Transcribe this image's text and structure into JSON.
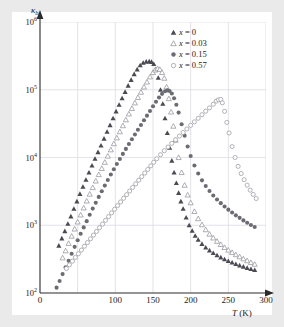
{
  "figure": {
    "axis_y_title": "κ",
    "axis_y_subscript": "b",
    "axis_x_title_symbol": "T",
    "axis_x_title_unit": " (K)"
  },
  "legend": {
    "items": [
      {
        "label": "x = 0",
        "marker": "filled-triangle-up",
        "color": "#4a4a52"
      },
      {
        "label": "x = 0.03",
        "marker": "open-triangle-up",
        "color": "#8d8d95"
      },
      {
        "label": "x = 0.15",
        "marker": "filled-circle",
        "color": "#6b6b73"
      },
      {
        "label": "x = 0.57",
        "marker": "open-circle",
        "color": "#9a9aa2"
      }
    ]
  },
  "chart_data": {
    "type": "scatter",
    "title": "",
    "xlabel": "T (K)",
    "ylabel": "κ_b",
    "xlim": [
      0,
      300
    ],
    "ylim": [
      100,
      1000000
    ],
    "yscale": "log",
    "xticks": [
      0,
      50,
      100,
      150,
      200,
      250,
      300
    ],
    "xticklabels": [
      "0",
      "",
      "100",
      "150",
      "200",
      "250",
      "300"
    ],
    "yticks": [
      100,
      1000,
      10000,
      100000,
      1000000
    ],
    "yticklabels": [
      "10²",
      "10³",
      "10⁴",
      "10⁵",
      "10⁶"
    ],
    "grid": true,
    "legend_position": "top-right",
    "series": [
      {
        "name": "x = 0",
        "marker": "filled-triangle-up",
        "color": "#4a4a52",
        "peak_temperature": 150,
        "peak_value": 260000,
        "x": [
          25,
          29,
          33,
          37,
          41,
          45,
          49,
          53,
          57,
          61,
          65,
          69,
          73,
          77,
          81,
          85,
          89,
          93,
          97,
          101,
          105,
          109,
          113,
          117,
          121,
          125,
          129,
          133,
          137,
          141,
          145,
          148,
          151,
          154,
          157,
          160,
          163,
          166,
          169,
          172,
          175,
          178,
          181,
          184,
          187,
          190,
          194,
          198,
          202,
          206,
          210,
          215,
          220,
          225,
          230,
          235,
          240,
          245,
          250,
          255,
          260,
          265,
          270,
          275,
          280,
          285
        ],
        "y": [
          500,
          640,
          820,
          1050,
          1350,
          1750,
          2250,
          2900,
          3700,
          4700,
          6000,
          7600,
          9600,
          12000,
          15000,
          19000,
          24000,
          30000,
          38000,
          48000,
          60000,
          75000,
          93000,
          115000,
          140000,
          170000,
          200000,
          230000,
          250000,
          260000,
          262000,
          258000,
          240000,
          200000,
          150000,
          100000,
          62000,
          38000,
          23000,
          14000,
          9000,
          6000,
          4200,
          3000,
          2250,
          1750,
          1300,
          1000,
          830,
          700,
          610,
          530,
          470,
          425,
          390,
          360,
          335,
          315,
          297,
          282,
          268,
          256,
          245,
          235,
          226,
          218
        ]
      },
      {
        "name": "x = 0.03",
        "marker": "open-triangle-up",
        "color": "#8d8d95",
        "peak_temperature": 157,
        "peak_value": 205000,
        "x": [
          30,
          34,
          38,
          42,
          46,
          50,
          54,
          58,
          62,
          66,
          70,
          74,
          78,
          82,
          86,
          90,
          94,
          98,
          102,
          106,
          110,
          114,
          118,
          122,
          126,
          130,
          134,
          138,
          142,
          146,
          150,
          153,
          156,
          159,
          162,
          165,
          168,
          171,
          174,
          177,
          180,
          184,
          188,
          192,
          196,
          200,
          205,
          210,
          215,
          220,
          225,
          230,
          235,
          240,
          245,
          250,
          255,
          260,
          265,
          270,
          275,
          280,
          285
        ],
        "y": [
          330,
          420,
          540,
          690,
          880,
          1120,
          1420,
          1800,
          2280,
          2880,
          3600,
          4500,
          5600,
          6900,
          8500,
          10500,
          13000,
          16000,
          19500,
          24000,
          29500,
          36000,
          44000,
          53000,
          64000,
          77000,
          92000,
          110000,
          130000,
          155000,
          180000,
          196000,
          205000,
          200000,
          180000,
          148000,
          110000,
          74000,
          47000,
          29000,
          18000,
          10000,
          6000,
          3900,
          2800,
          2150,
          1600,
          1250,
          1020,
          860,
          740,
          650,
          580,
          520,
          470,
          430,
          397,
          368,
          343,
          320,
          300,
          282,
          266
        ]
      },
      {
        "name": "x = 0.15",
        "marker": "filled-circle",
        "color": "#6b6b73",
        "peak_temperature": 172,
        "peak_value": 98000,
        "x": [
          22,
          26,
          30,
          34,
          38,
          42,
          46,
          50,
          54,
          58,
          62,
          66,
          70,
          74,
          78,
          82,
          86,
          90,
          94,
          98,
          102,
          106,
          110,
          114,
          118,
          122,
          126,
          130,
          134,
          138,
          142,
          146,
          150,
          154,
          158,
          162,
          166,
          169,
          172,
          175,
          178,
          181,
          184,
          188,
          192,
          196,
          200,
          205,
          210,
          215,
          220,
          225,
          230,
          235,
          240,
          245,
          250,
          255,
          260,
          265,
          270,
          275,
          280,
          285
        ],
        "y": [
          120,
          150,
          190,
          240,
          300,
          380,
          480,
          600,
          750,
          930,
          1150,
          1430,
          1760,
          2150,
          2620,
          3180,
          3850,
          4650,
          5600,
          6700,
          8000,
          9500,
          11300,
          13400,
          15800,
          18600,
          21900,
          25700,
          30200,
          35400,
          41500,
          48600,
          57000,
          66500,
          77000,
          87000,
          95000,
          98000,
          96000,
          88000,
          75000,
          60000,
          46000,
          31000,
          21000,
          14500,
          10500,
          7600,
          5800,
          4600,
          3800,
          3200,
          2750,
          2400,
          2120,
          1890,
          1700,
          1540,
          1400,
          1285,
          1180,
          1090,
          1010,
          940
        ]
      },
      {
        "name": "x = 0.57",
        "marker": "open-circle",
        "color": "#9a9aa2",
        "peak_temperature": 240,
        "peak_value": 72000,
        "x": [
          35,
          39,
          43,
          47,
          51,
          55,
          59,
          63,
          67,
          71,
          75,
          79,
          83,
          87,
          91,
          95,
          99,
          103,
          107,
          111,
          115,
          119,
          123,
          127,
          131,
          135,
          139,
          143,
          147,
          151,
          155,
          160,
          165,
          170,
          175,
          180,
          185,
          190,
          195,
          200,
          205,
          210,
          215,
          220,
          225,
          230,
          234,
          237,
          240,
          242,
          245,
          248,
          251,
          255,
          259,
          263,
          267,
          271,
          275,
          279,
          283,
          287
        ],
        "y": [
          230,
          260,
          295,
          335,
          380,
          430,
          490,
          555,
          630,
          715,
          810,
          920,
          1040,
          1180,
          1340,
          1520,
          1720,
          1950,
          2210,
          2500,
          2830,
          3200,
          3620,
          4090,
          4620,
          5220,
          5900,
          6660,
          7530,
          8500,
          9600,
          11000,
          12600,
          14300,
          16200,
          18300,
          20700,
          23400,
          26400,
          29800,
          33600,
          37900,
          42800,
          48300,
          54000,
          61000,
          68000,
          71000,
          72000,
          64000,
          48000,
          33000,
          23000,
          14500,
          10000,
          7400,
          5800,
          4700,
          3900,
          3300,
          2850,
          2480
        ]
      }
    ]
  }
}
